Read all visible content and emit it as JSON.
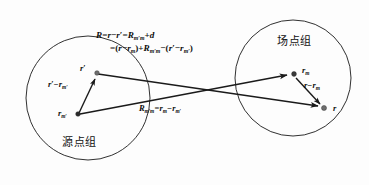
{
  "figure": {
    "title_alt": "Source point group and field point group vector decomposition diagram",
    "background_color": "#fdfdfd",
    "stroke_color": "#1a1a1a",
    "dot_color": "#6e6e6e"
  },
  "formula": {
    "line1": {
      "lhs": "R",
      "text": "R=r−r′=R",
      "sub1": "m′m",
      "tail": "+d"
    },
    "line2": {
      "text": "=(r−r",
      "sub1": "m",
      "mid": ")+R",
      "sub2": "m′m",
      "mid2": "−(r′−r",
      "sub3": "m′",
      "tail": ")"
    }
  },
  "groups": [
    {
      "id": "source-group",
      "label": "源点组",
      "cx": 88,
      "cy": 98,
      "r": 62
    },
    {
      "id": "field-group",
      "label": "场点组",
      "cx": 293,
      "cy": 78,
      "r": 58
    }
  ],
  "points": [
    {
      "id": "r-prime",
      "label": "r",
      "sub": "",
      "prime": true,
      "x": 95,
      "y": 72
    },
    {
      "id": "r-m-prime",
      "label": "r",
      "sub": "m",
      "prime": true,
      "x": 77,
      "y": 114
    },
    {
      "id": "r-m",
      "label": "r",
      "sub": "m",
      "prime": false,
      "x": 294,
      "y": 74
    },
    {
      "id": "r-field",
      "label": "r",
      "sub": "",
      "prime": false,
      "x": 325,
      "y": 108
    }
  ],
  "vector_labels": {
    "r_prime_minus_rm_prime": {
      "base": "r",
      "prime1": true,
      "op": "−",
      "base2": "r",
      "sub2": "m",
      "prime2": true
    },
    "Rm_prime_m_equation": {
      "base": "R",
      "sub": "m′m",
      "eq": "=",
      "t1": "r",
      "s1": "m",
      "op": "−",
      "t2": "r",
      "s2": "m′"
    },
    "r_minus_rm": {
      "base": "r",
      "op": "−",
      "base2": "r",
      "sub2": "m"
    }
  },
  "text": {
    "source_group_label": "源点组",
    "field_group_label": "场点组",
    "prime_glyph": "′",
    "minus_glyph": "−",
    "plus_glyph": "+",
    "equals_glyph": "="
  }
}
